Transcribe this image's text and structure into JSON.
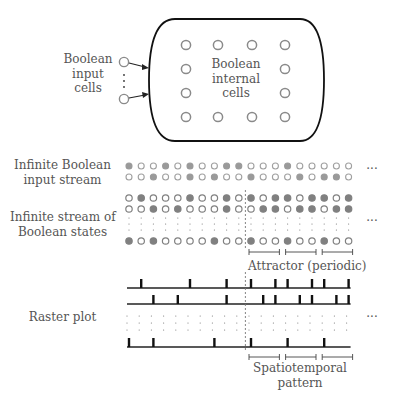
{
  "network": {
    "input_label": [
      "Boolean",
      "input",
      "cells"
    ],
    "internal_label": [
      "Boolean",
      "internal",
      "cells"
    ],
    "internal_grid": {
      "cols": 4,
      "rows": 4
    }
  },
  "input_stream": {
    "label": [
      "Infinite Boolean",
      "input stream"
    ],
    "rows": [
      [
        1,
        0,
        0,
        1,
        0,
        1,
        0,
        0,
        1,
        1,
        0,
        0,
        0,
        1,
        0,
        0,
        0,
        0,
        0
      ],
      [
        0,
        0,
        1,
        0,
        0,
        1,
        0,
        1,
        0,
        0,
        1,
        0,
        0,
        0,
        1,
        0,
        1,
        1,
        0
      ]
    ],
    "ellipsis": "···"
  },
  "state_stream": {
    "label": [
      "Infinite stream of",
      "Boolean states"
    ],
    "rows": [
      [
        0,
        1,
        0,
        0,
        0,
        1,
        0,
        0,
        1,
        0,
        1,
        0,
        1,
        1,
        0,
        1,
        1,
        0,
        1
      ],
      [
        0,
        0,
        1,
        0,
        1,
        0,
        0,
        0,
        1,
        0,
        0,
        1,
        1,
        0,
        1,
        1,
        0,
        1,
        1
      ],
      [
        1,
        0,
        1,
        0,
        0,
        0,
        0,
        1,
        0,
        0,
        1,
        0,
        0,
        1,
        0,
        0,
        1,
        0,
        0
      ]
    ],
    "transient_length": 10,
    "period": 3,
    "ellipsis": "···",
    "attractor_label": "Attractor (periodic)"
  },
  "raster": {
    "label": "Raster plot",
    "pattern_label": [
      "Spatiotemporal",
      "pattern"
    ],
    "ellipsis": "···"
  },
  "colors": {
    "filled_dot": "#808080",
    "empty_dot_stroke": "#8a8a8a",
    "input_filled": "#9a9a9a",
    "line": "#222222",
    "text": "#555555"
  }
}
